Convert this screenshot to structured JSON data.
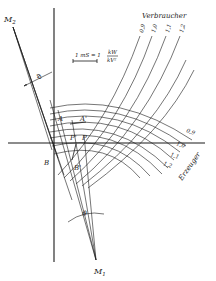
{
  "diagram": {
    "type": "power-circle diagram",
    "colors": {
      "ink": "#1a1a1a",
      "background": "#ffffff"
    },
    "labels": {
      "consumer": "Verbraucher",
      "generator": "Erzeuger",
      "center_top": "M",
      "center_top_sub": "2",
      "center_bottom": "M",
      "center_bottom_sub": "1",
      "angle_top": "ϑ",
      "angle_bottom": "ϑ",
      "point_A": "A",
      "point_A_prime": "A'",
      "point_B": "B",
      "point_B_prime": "B'",
      "point_P": "P",
      "point_P_prime": "P'"
    },
    "scale": {
      "text": "1 mS = 1",
      "numerator": "kW",
      "denominator": "kV²"
    },
    "consumer_curves": [
      "0,9",
      "1,0",
      "1,1",
      "1,2"
    ],
    "generator_curves": [
      "0,9",
      "1,0",
      "1,1",
      "1,2"
    ]
  }
}
